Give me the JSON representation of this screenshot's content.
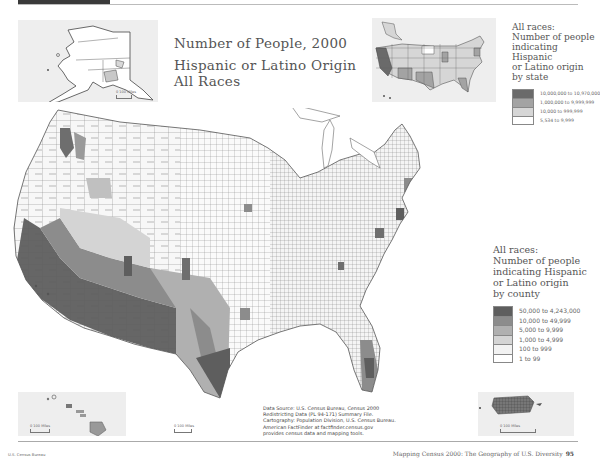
{
  "header": {
    "bar_color": "#3a3a3a"
  },
  "title": {
    "line1": "Number of People, 2000",
    "line2": "Hispanic or Latino Origin",
    "line3": "All Races"
  },
  "state_legend": {
    "title_lines": [
      "All races:",
      "Number of people",
      "indicating Hispanic",
      "or Latino origin",
      "by state"
    ],
    "classes": [
      {
        "label": "10,000,000 to 10,970,000",
        "color": "#6a6a6a"
      },
      {
        "label": "1,000,000 to 9,999,999",
        "color": "#a3a3a3"
      },
      {
        "label": "10,000 to 999,999",
        "color": "#d6d6d6"
      },
      {
        "label": "5,534 to 9,999",
        "color": "#ffffff"
      }
    ]
  },
  "county_legend": {
    "title_lines": [
      "All races:",
      "Number of people",
      "indicating Hispanic",
      "or Latino origin",
      "by county"
    ],
    "classes": [
      {
        "label": "50,000 to 4,243,000",
        "color": "#5e5e5e"
      },
      {
        "label": "10,000 to 49,999",
        "color": "#8c8c8c"
      },
      {
        "label": "5,000 to 9,999",
        "color": "#b0b0b0"
      },
      {
        "label": "1,000 to 4,999",
        "color": "#d4d4d4"
      },
      {
        "label": "100 to 999",
        "color": "#f2f2f2"
      },
      {
        "label": "1 to 99",
        "color": "#ffffff"
      }
    ]
  },
  "insets": {
    "alaska": {
      "scale_label": "0    100 Miles"
    },
    "hawaii": {
      "scale_label": "0       100 Miles"
    },
    "conus_scale": {
      "scale_label": "0       100 Miles"
    },
    "puerto_rico": {
      "scale_label": "0                100 Miles"
    }
  },
  "source_note": {
    "lines": [
      "Data Source: U.S. Census Bureau, Census 2000",
      "Redistricting Data (PL 94-171) Summary File.",
      "Cartography: Population Division, U.S. Census Bureau.",
      "American FactFinder at factfinder.census.gov",
      "provides census data and mapping tools."
    ]
  },
  "footer": {
    "left": "U.S. Census Bureau",
    "right": "Mapping Census 2000: The Geography of U.S. Diversity",
    "page_number": "95"
  }
}
